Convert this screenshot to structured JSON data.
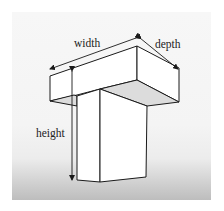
{
  "diagram": {
    "labels": {
      "width": "width",
      "depth": "depth",
      "height": "height"
    },
    "colors": {
      "outline": "#1a1a1a",
      "face": "#ffffff",
      "shaded_face": "#dcdcdc",
      "background_top": "#f7f7f7",
      "background_bottom": "#bdbdbd"
    }
  }
}
